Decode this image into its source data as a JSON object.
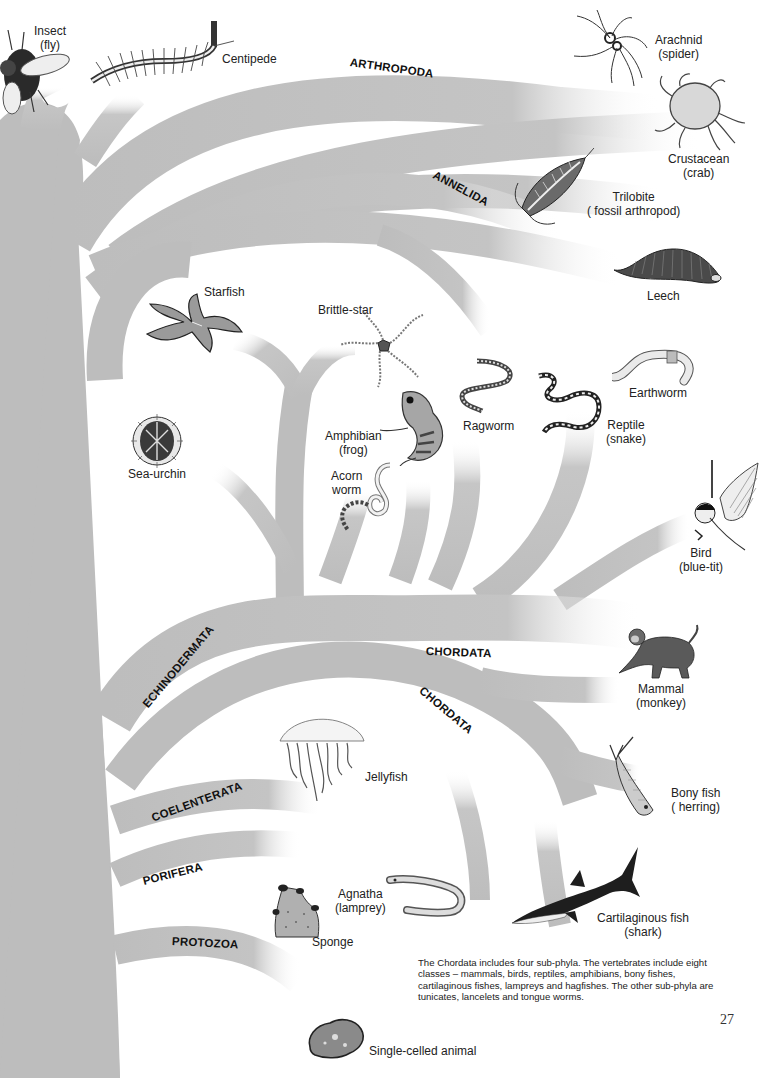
{
  "page": {
    "page_number": "27",
    "caption": "The Chordata includes four sub-phyla. The vertebrates include eight classes – mammals, birds, reptiles, amphibians, bony fishes, cartilaginous fishes, lampreys and hagfishes. The other sub-phyla are tunicates, lancelets and tongue worms.",
    "colors": {
      "branch": "#bdbdbd",
      "background": "#ffffff",
      "text": "#1a1a1a"
    }
  },
  "phyla": {
    "arthropoda": "ARTHROPODA",
    "annelida": "ANNELIDA",
    "echinodermata": "ECHINODERMATA",
    "chordata_1": "CHORDATA",
    "chordata_2": "CHORDATA",
    "coelenterata": "COELENTERATA",
    "porifera": "PORIFERA",
    "protozoa": "PROTOZOA"
  },
  "animals": {
    "insect": {
      "name": "Insect",
      "detail": "(fly)",
      "icon": "fly-icon"
    },
    "centipede": {
      "name": "Centipede",
      "icon": "centipede-icon"
    },
    "arachnid": {
      "name": "Arachnid",
      "detail": "(spider)",
      "icon": "spider-icon"
    },
    "crustacean": {
      "name": "Crustacean",
      "detail": "(crab)",
      "icon": "crab-icon"
    },
    "trilobite": {
      "name": "Trilobite",
      "detail": "( fossil arthropod)",
      "icon": "trilobite-icon"
    },
    "leech": {
      "name": "Leech",
      "icon": "leech-icon"
    },
    "starfish": {
      "name": "Starfish",
      "icon": "starfish-icon"
    },
    "brittle_star": {
      "name": "Brittle-star",
      "icon": "brittle-star-icon"
    },
    "sea_urchin": {
      "name": "Sea-urchin",
      "icon": "sea-urchin-icon"
    },
    "amphibian": {
      "name": "Amphibian",
      "detail": "(frog)",
      "icon": "frog-icon"
    },
    "acorn_worm": {
      "name": "Acorn",
      "detail": "worm",
      "icon": "acorn-worm-icon"
    },
    "ragworm": {
      "name": "Ragworm",
      "icon": "ragworm-icon"
    },
    "reptile": {
      "name": "Reptile",
      "detail": "(snake)",
      "icon": "snake-icon"
    },
    "earthworm": {
      "name": "Earthworm",
      "icon": "earthworm-icon"
    },
    "bird": {
      "name": "Bird",
      "detail": "(blue-tit)",
      "icon": "bird-icon"
    },
    "mammal": {
      "name": "Mammal",
      "detail": "(monkey)",
      "icon": "monkey-icon"
    },
    "jellyfish": {
      "name": "Jellyfish",
      "icon": "jellyfish-icon"
    },
    "bony_fish": {
      "name": "Bony fish",
      "detail": "( herring)",
      "icon": "herring-icon"
    },
    "agnatha": {
      "name": "Agnatha",
      "detail": "(lamprey)",
      "icon": "lamprey-icon"
    },
    "sponge": {
      "name": "Sponge",
      "icon": "sponge-icon"
    },
    "cartilaginous_fish": {
      "name": "Cartilaginous fish",
      "detail": "(shark)",
      "icon": "shark-icon"
    },
    "single_celled": {
      "name": "Single-celled animal",
      "icon": "amoeba-icon"
    }
  }
}
